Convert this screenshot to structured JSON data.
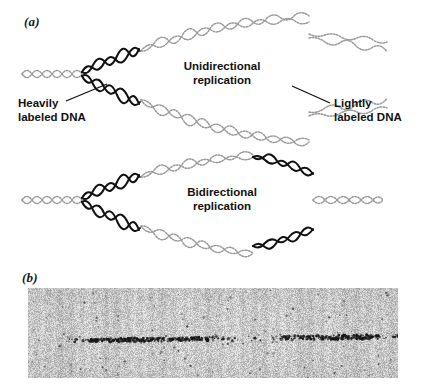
{
  "figure": {
    "panels": [
      {
        "id": "a",
        "label": "(a)"
      },
      {
        "id": "b",
        "label": "(b)"
      }
    ]
  },
  "panel_a": {
    "diagrams": [
      {
        "id": "unidirectional",
        "caption_line1": "Unidirectional",
        "caption_line2": "replication",
        "mode": "unidirectional",
        "description": "Replication bubble with heavily labeled (dark) DNA only at the left fork; remainder lightly labeled (stippled)."
      },
      {
        "id": "bidirectional",
        "caption_line1": "Bidirectional",
        "caption_line2": "replication",
        "mode": "bidirectional",
        "description": "Replication bubble with heavily labeled (dark) DNA at both the left and right forks; center lightly labeled (stippled)."
      }
    ],
    "callouts": [
      {
        "id": "heavily-labeled",
        "line1": "Heavily",
        "line2": "labeled DNA",
        "side": "left",
        "has_leader_line": true
      },
      {
        "id": "lightly-labeled",
        "line1": "Lightly",
        "line2": "labeled DNA",
        "side": "right",
        "has_leader_line": true
      }
    ]
  },
  "panel_b": {
    "image_type": "autoradiograph",
    "description": "Grayscale autoradiograph film showing a horizontal track of dark silver grains with a lighter gap near the center.",
    "track": {
      "dense_segments": 2,
      "gap_position": "center"
    }
  },
  "colors": {
    "heavy_strand": "#111111",
    "light_strand": "#9a9a9a",
    "text": "#111111",
    "background": "#ffffff",
    "film_base": "#c8c8c8",
    "film_grain": "#6e6e6e"
  }
}
